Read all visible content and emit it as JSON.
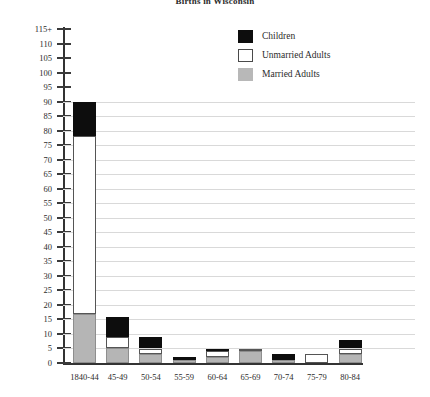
{
  "chart_data": {
    "type": "bar",
    "title": "Births in Wisconsin",
    "xlabel": "",
    "ylabel": "",
    "stacked": true,
    "grid": true,
    "legend_position": "top-right",
    "ylim": [
      0,
      115
    ],
    "ytick_step": 5,
    "ytick_labels": [
      "115+",
      "110",
      "105",
      "100",
      "95",
      "90",
      "85",
      "80",
      "75",
      "70",
      "65",
      "60",
      "55",
      "50",
      "45",
      "40",
      "35",
      "30",
      "25",
      "20",
      "15",
      "10",
      "5",
      "0"
    ],
    "categories": [
      "1840-44",
      "45-49",
      "50-54",
      "55-59",
      "60-64",
      "65-69",
      "70-74",
      "75-79",
      "80-84"
    ],
    "series": [
      {
        "name": "Married Adults",
        "color": "#b5b5b5",
        "values": [
          17,
          5,
          3,
          1,
          2,
          4,
          1,
          0,
          3
        ]
      },
      {
        "name": "Unmarried Adults",
        "color": "#ffffff",
        "values": [
          61,
          4,
          2,
          0,
          2,
          1,
          0,
          3,
          2
        ]
      },
      {
        "name": "Children",
        "color": "#0d0d0d",
        "values": [
          12,
          7,
          4,
          1,
          1,
          0,
          2,
          0,
          3
        ]
      }
    ],
    "totals": [
      90,
      16,
      9,
      2,
      5,
      5,
      3,
      3,
      8
    ]
  },
  "legend": {
    "items": [
      {
        "label": "Children",
        "swatch": "black-swatch"
      },
      {
        "label": "Unmarried Adults",
        "swatch": "white-swatch"
      },
      {
        "label": "Married Adults",
        "swatch": "gray-swatch"
      }
    ]
  }
}
